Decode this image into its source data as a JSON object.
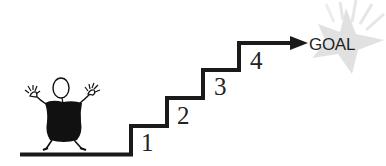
{
  "diagram": {
    "type": "staircase-to-goal",
    "goal": {
      "label": "GOAL",
      "burst_color": "#d9d9d9"
    },
    "steps": [
      {
        "number": "1"
      },
      {
        "number": "2"
      },
      {
        "number": "3"
      },
      {
        "number": "4"
      }
    ],
    "colors": {
      "line": "#1a1a1a",
      "figure": "#111111",
      "background": "#ffffff"
    }
  }
}
